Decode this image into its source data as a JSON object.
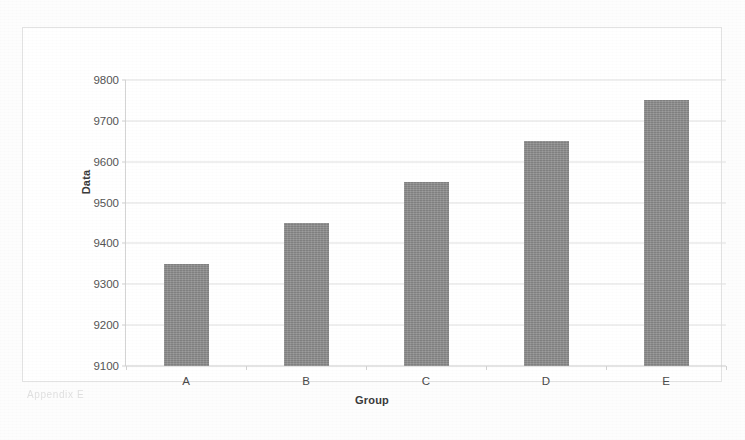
{
  "chart_data": {
    "type": "bar",
    "title": "",
    "xlabel": "Group",
    "ylabel": "Data",
    "categories": [
      "A",
      "B",
      "C",
      "D",
      "E"
    ],
    "values": [
      9350,
      9450,
      9550,
      9650,
      9750
    ],
    "ylim": [
      9100,
      9800
    ],
    "yticks": [
      9100,
      9200,
      9300,
      9400,
      9500,
      9600,
      9700,
      9800
    ],
    "ytick_labels": [
      "9100",
      "9200",
      "9300",
      "9400",
      "9500",
      "9600",
      "9700",
      "9800"
    ],
    "grid": true,
    "legend": false,
    "bar_color": "#8c8c8c",
    "gridline_color": "#e0e0e0"
  },
  "frame": {
    "border_color": "#e2e2e2",
    "background": "#ffffff"
  },
  "artifact": {
    "ghost_caption": "Appendix E"
  }
}
